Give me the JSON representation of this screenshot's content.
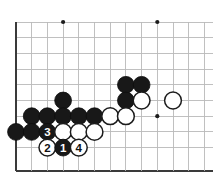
{
  "diagram": {
    "kind": "go-board-diagram",
    "board": {
      "columns": 13,
      "rows": 10,
      "origin_x": 16,
      "origin_y": 22,
      "spacing": 15.7,
      "bottom_edge_y": 171,
      "edges": {
        "left": true,
        "bottom": true,
        "top": false,
        "right": false
      },
      "line_color": "#b9b9b9",
      "edge_color": "#3a3a3a",
      "star_points": [
        {
          "col": 3,
          "row": 0
        },
        {
          "col": 9,
          "row": 0
        },
        {
          "col": 9,
          "row": 6
        }
      ]
    },
    "stone_radius": 8.4,
    "colors": {
      "black_stone": "#181818",
      "white_stone": "#ffffff",
      "black_stone_label": "#ffffff",
      "white_stone_label": "#111111",
      "star_point": "#1c1c1c"
    },
    "stones": [
      {
        "col": 3,
        "row": 5,
        "color": "black",
        "label": ""
      },
      {
        "col": 7,
        "row": 4,
        "color": "black",
        "label": ""
      },
      {
        "col": 8,
        "row": 4,
        "color": "black",
        "label": ""
      },
      {
        "col": 7,
        "row": 5,
        "color": "black",
        "label": ""
      },
      {
        "col": 8,
        "row": 5,
        "color": "white",
        "label": ""
      },
      {
        "col": 10,
        "row": 5,
        "color": "white",
        "label": ""
      },
      {
        "col": 1,
        "row": 6,
        "color": "black",
        "label": ""
      },
      {
        "col": 2,
        "row": 6,
        "color": "black",
        "label": ""
      },
      {
        "col": 3,
        "row": 6,
        "color": "black",
        "label": ""
      },
      {
        "col": 4,
        "row": 6,
        "color": "black",
        "label": ""
      },
      {
        "col": 5,
        "row": 6,
        "color": "black",
        "label": ""
      },
      {
        "col": 6,
        "row": 6,
        "color": "white",
        "label": ""
      },
      {
        "col": 7,
        "row": 6,
        "color": "white",
        "label": ""
      },
      {
        "col": 0,
        "row": 7,
        "color": "black",
        "label": ""
      },
      {
        "col": 1,
        "row": 7,
        "color": "black",
        "label": ""
      },
      {
        "col": 2,
        "row": 7,
        "color": "black",
        "label": "3"
      },
      {
        "col": 3,
        "row": 7,
        "color": "white",
        "label": ""
      },
      {
        "col": 4,
        "row": 7,
        "color": "white",
        "label": ""
      },
      {
        "col": 5,
        "row": 7,
        "color": "white",
        "label": ""
      },
      {
        "col": 2,
        "row": 8,
        "color": "white",
        "label": "2"
      },
      {
        "col": 3,
        "row": 8,
        "color": "black",
        "label": "1"
      },
      {
        "col": 4,
        "row": 8,
        "color": "white",
        "label": "4"
      }
    ],
    "move_sequence": [
      {
        "number": "1",
        "color": "black",
        "col": 3,
        "row": 8
      },
      {
        "number": "2",
        "color": "white",
        "col": 2,
        "row": 8
      },
      {
        "number": "3",
        "color": "black",
        "col": 2,
        "row": 7
      },
      {
        "number": "4",
        "color": "white",
        "col": 4,
        "row": 8
      }
    ]
  }
}
